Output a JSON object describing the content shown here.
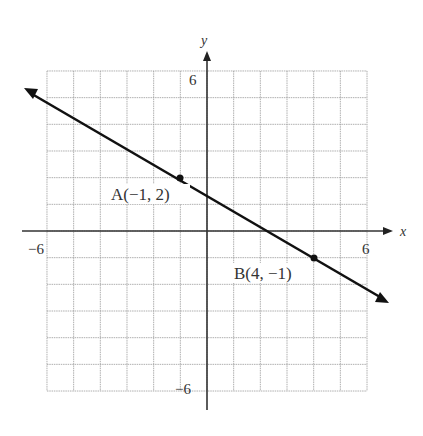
{
  "chart_data": {
    "type": "line",
    "title": "",
    "xlabel": "x",
    "ylabel": "y",
    "xlim": [
      -6,
      6
    ],
    "ylim": [
      -6,
      6
    ],
    "grid": true,
    "x_tick_labels": [
      "-6",
      "6"
    ],
    "y_tick_labels": [
      "6",
      "-6"
    ],
    "series": [
      {
        "name": "line AB",
        "slope": -0.6,
        "intercept": 1.4,
        "points": [
          {
            "label": "A(−1, 2)",
            "x": -1,
            "y": 2
          },
          {
            "label": "B(4, −1)",
            "x": 4,
            "y": -1
          }
        ]
      }
    ]
  },
  "axes": {
    "x_label": "x",
    "y_label": "y",
    "x_min_label": "−6",
    "x_max_label": "6",
    "y_max_label": "6",
    "y_min_label": "−6"
  },
  "points": {
    "a_label": "A(−1, 2)",
    "b_label": "B(4, −1)"
  },
  "colors": {
    "grid": "#9a9a9a",
    "axis": "#333333",
    "line": "#111111"
  }
}
